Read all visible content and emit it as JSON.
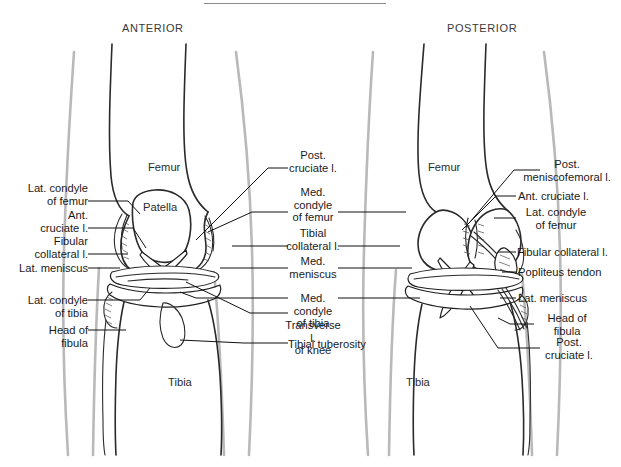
{
  "figure": {
    "title_rule_visible": true,
    "background_color": "#ffffff",
    "ink_color": "#1a1a1a",
    "silhouette_color": "#b9b9b9"
  },
  "headings": {
    "anterior": "ANTERIOR",
    "posterior": "POSTERIOR"
  },
  "bone_names": {
    "femur_left": "Femur",
    "patella": "Patella",
    "tibia_left": "Tibia",
    "femur_right": "Femur",
    "tibia_right": "Tibia"
  },
  "labels_left": [
    {
      "text": "Lat. condyle\nof femur"
    },
    {
      "text": "Ant.\ncruciate l."
    },
    {
      "text": "Fibular\ncollateral l."
    },
    {
      "text": "Lat. meniscus"
    },
    {
      "text": "Lat. condyle\nof tibia"
    },
    {
      "text": "Head of\nfibula"
    }
  ],
  "labels_center": [
    {
      "text": "Post.\ncruciate l."
    },
    {
      "text": "Med.\ncondyle\nof femur"
    },
    {
      "text": "Tibial\ncollateral l."
    },
    {
      "text": "Med.\nmeniscus"
    },
    {
      "text": "Med. condyle\nof tibia"
    },
    {
      "text": "Transverse l.\nof knee"
    },
    {
      "text": "Tibial tuberosity"
    }
  ],
  "labels_right": [
    {
      "text": "Post.\nmeniscofemoral l."
    },
    {
      "text": "Ant. cruciate l."
    },
    {
      "text": "Lat. condyle\nof femur"
    },
    {
      "text": "Fibular collateral l."
    },
    {
      "text": "Popliteus tendon"
    },
    {
      "text": "Lat. meniscus"
    },
    {
      "text": "Head of\nfibula"
    },
    {
      "text": "Post.\ncruciate l."
    }
  ]
}
